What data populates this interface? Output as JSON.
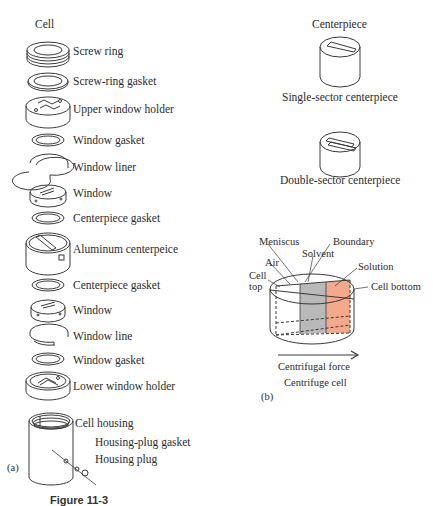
{
  "figure": {
    "caption": "Figure 11-3"
  },
  "panel_a": {
    "title": "Cell",
    "tag": "(a)",
    "parts": [
      {
        "label": "Screw ring"
      },
      {
        "label": "Screw-ring gasket"
      },
      {
        "label": "Upper window holder"
      },
      {
        "label": "Window gasket"
      },
      {
        "label": "Window liner"
      },
      {
        "label": "Window"
      },
      {
        "label": "Centerpiece gasket"
      },
      {
        "label": "Aluminum centerpeice"
      },
      {
        "label": "Centerpiece gasket"
      },
      {
        "label": "Window"
      },
      {
        "label": "Window line"
      },
      {
        "label": "Window gasket"
      },
      {
        "label": "Lower window holder"
      },
      {
        "label": "Cell housing"
      },
      {
        "label": "Housing-plug gasket"
      },
      {
        "label": "Housing plug"
      }
    ]
  },
  "panel_b": {
    "tag": "(b)",
    "centerpiece_title": "Centerpiece",
    "single_sector": "Single-sector centerpiece",
    "double_sector": "Double-sector centerpiece",
    "cell_labels": {
      "meniscus": "Meniscus",
      "boundary": "Boundary",
      "solvent": "Solvent",
      "solution": "Solution",
      "air": "Air",
      "cell_top_1": "Cell",
      "cell_top_2": "top",
      "cell_bottom": "Cell bottom"
    },
    "arrow_label": "Centrifugal force",
    "subtitle": "Centrifuge cell",
    "colors": {
      "solvent": "#b9b9b9",
      "solution": "#f4a98a"
    }
  }
}
